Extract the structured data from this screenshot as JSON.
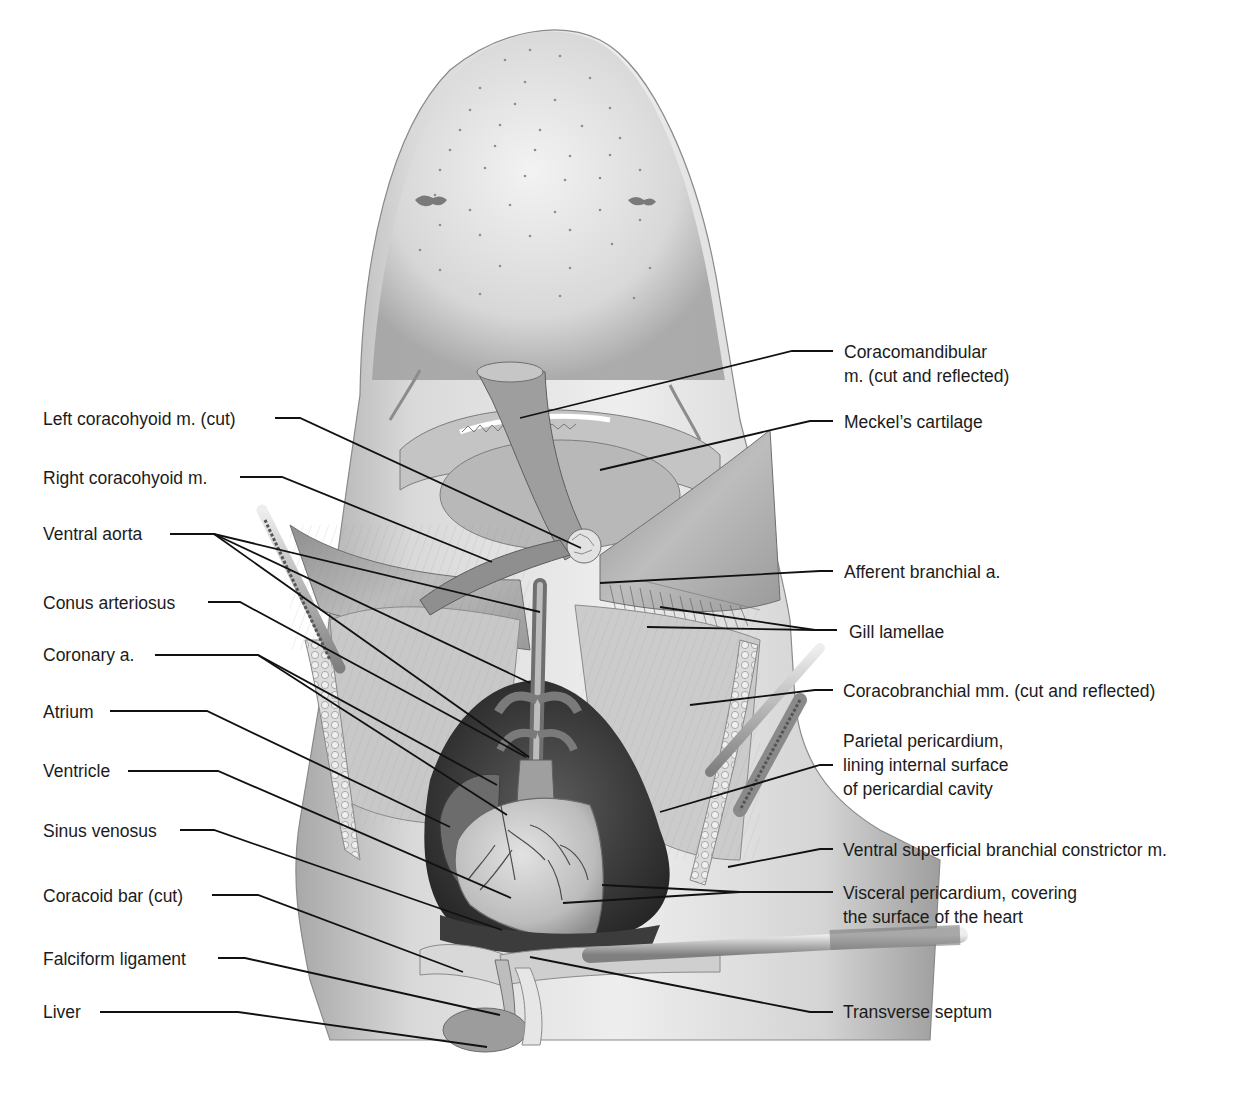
{
  "figure": {
    "colors": {
      "background": "#ffffff",
      "skin_light": "#e6e6e6",
      "skin_mid": "#bdbdbd",
      "skin_dark": "#8a8a8a",
      "muscle": "#a9a9a9",
      "heart": "#cfcfcf",
      "cavity": "#3a3a3a",
      "leader": "#111111"
    }
  },
  "labels_left": [
    {
      "id": "left-coracohyoid",
      "lines": [
        "Left coracohyoid m. (cut)"
      ],
      "x": 43,
      "y": 407
    },
    {
      "id": "right-coracohyoid",
      "lines": [
        "Right coracohyoid m."
      ],
      "x": 43,
      "y": 466
    },
    {
      "id": "ventral-aorta",
      "lines": [
        "Ventral aorta"
      ],
      "x": 43,
      "y": 522
    },
    {
      "id": "conus-arteriosus",
      "lines": [
        "Conus arteriosus"
      ],
      "x": 43,
      "y": 591
    },
    {
      "id": "coronary-a",
      "lines": [
        "Coronary a."
      ],
      "x": 43,
      "y": 643
    },
    {
      "id": "atrium",
      "lines": [
        "Atrium"
      ],
      "x": 43,
      "y": 700
    },
    {
      "id": "ventricle",
      "lines": [
        "Ventricle"
      ],
      "x": 43,
      "y": 759
    },
    {
      "id": "sinus-venosus",
      "lines": [
        "Sinus venosus"
      ],
      "x": 43,
      "y": 819
    },
    {
      "id": "coracoid-bar",
      "lines": [
        "Coracoid bar (cut)"
      ],
      "x": 43,
      "y": 884
    },
    {
      "id": "falciform-ligament",
      "lines": [
        "Falciform ligament"
      ],
      "x": 43,
      "y": 947
    },
    {
      "id": "liver",
      "lines": [
        "Liver"
      ],
      "x": 43,
      "y": 1000
    }
  ],
  "labels_right": [
    {
      "id": "coracomandibular",
      "lines": [
        "Coracomandibular",
        "m. (cut and reflected)"
      ],
      "x": 844,
      "y": 340
    },
    {
      "id": "meckels-cartilage",
      "lines": [
        "Meckel’s cartilage"
      ],
      "x": 844,
      "y": 410
    },
    {
      "id": "afferent-branchial",
      "lines": [
        "Afferent branchial a."
      ],
      "x": 844,
      "y": 560
    },
    {
      "id": "gill-lamellae",
      "lines": [
        "Gill lamellae"
      ],
      "x": 849,
      "y": 620
    },
    {
      "id": "coracobranchial",
      "lines": [
        "Coracobranchial mm. (cut and reflected)"
      ],
      "x": 843,
      "y": 679
    },
    {
      "id": "parietal-pericardium",
      "lines": [
        "Parietal pericardium,",
        "lining internal surface",
        "of pericardial cavity"
      ],
      "x": 843,
      "y": 729
    },
    {
      "id": "ventral-superficial",
      "lines": [
        "Ventral superficial branchial constrictor m."
      ],
      "x": 843,
      "y": 838
    },
    {
      "id": "visceral-pericardium",
      "lines": [
        "Visceral pericardium, covering",
        "the surface of the heart"
      ],
      "x": 843,
      "y": 881
    },
    {
      "id": "transverse-septum",
      "lines": [
        "Transverse septum"
      ],
      "x": 843,
      "y": 1000
    }
  ],
  "leaders": [
    {
      "for": "left-coracohyoid",
      "points": [
        [
          275,
          418
        ],
        [
          300,
          418
        ],
        [
          581,
          548
        ]
      ]
    },
    {
      "for": "right-coracohyoid",
      "points": [
        [
          240,
          477
        ],
        [
          282,
          477
        ],
        [
          492,
          562
        ]
      ]
    },
    {
      "for": "ventral-aorta",
      "points": [
        [
          170,
          534
        ],
        [
          214,
          534
        ],
        [
          540,
          612
        ]
      ]
    },
    {
      "for": "ventral-aorta",
      "points": [
        [
          214,
          534
        ],
        [
          530,
          683
        ]
      ]
    },
    {
      "for": "ventral-aorta",
      "points": [
        [
          214,
          534
        ],
        [
          529,
          757
        ]
      ]
    },
    {
      "for": "conus-arteriosus",
      "points": [
        [
          208,
          602
        ],
        [
          240,
          602
        ],
        [
          526,
          757
        ]
      ]
    },
    {
      "for": "coronary-a",
      "points": [
        [
          155,
          655
        ],
        [
          258,
          655
        ],
        [
          497,
          785
        ]
      ]
    },
    {
      "for": "coronary-a",
      "points": [
        [
          258,
          655
        ],
        [
          507,
          815
        ]
      ]
    },
    {
      "for": "atrium",
      "points": [
        [
          110,
          711
        ],
        [
          207,
          711
        ],
        [
          450,
          827
        ]
      ]
    },
    {
      "for": "ventricle",
      "points": [
        [
          128,
          771
        ],
        [
          218,
          771
        ],
        [
          511,
          898
        ]
      ]
    },
    {
      "for": "sinus-venosus",
      "points": [
        [
          180,
          830
        ],
        [
          214,
          830
        ],
        [
          502,
          930
        ]
      ]
    },
    {
      "for": "coracoid-bar",
      "points": [
        [
          212,
          895
        ],
        [
          258,
          895
        ],
        [
          463,
          972
        ]
      ]
    },
    {
      "for": "falciform-ligament",
      "points": [
        [
          218,
          958
        ],
        [
          245,
          958
        ],
        [
          500,
          1015
        ]
      ]
    },
    {
      "for": "liver",
      "points": [
        [
          100,
          1012
        ],
        [
          238,
          1012
        ],
        [
          487,
          1047
        ]
      ]
    },
    {
      "for": "coracomandibular",
      "points": [
        [
          833,
          351
        ],
        [
          792,
          351
        ],
        [
          520,
          418
        ]
      ]
    },
    {
      "for": "meckels-cartilage",
      "points": [
        [
          833,
          421
        ],
        [
          810,
          421
        ],
        [
          600,
          470
        ]
      ]
    },
    {
      "for": "afferent-branchial",
      "points": [
        [
          833,
          571
        ],
        [
          820,
          571
        ],
        [
          600,
          583
        ]
      ]
    },
    {
      "for": "gill-lamellae",
      "points": [
        [
          837,
          630
        ],
        [
          815,
          630
        ],
        [
          647,
          627
        ]
      ]
    },
    {
      "for": "gill-lamellae",
      "points": [
        [
          815,
          630
        ],
        [
          660,
          607
        ]
      ]
    },
    {
      "for": "coracobranchial",
      "points": [
        [
          833,
          690
        ],
        [
          815,
          690
        ],
        [
          690,
          705
        ]
      ]
    },
    {
      "for": "parietal-pericardium",
      "points": [
        [
          833,
          765
        ],
        [
          820,
          765
        ],
        [
          660,
          812
        ]
      ]
    },
    {
      "for": "ventral-superficial",
      "points": [
        [
          833,
          849
        ],
        [
          820,
          849
        ],
        [
          728,
          867
        ]
      ]
    },
    {
      "for": "visceral-pericardium",
      "points": [
        [
          833,
          892
        ],
        [
          740,
          892
        ],
        [
          602,
          885
        ]
      ]
    },
    {
      "for": "visceral-pericardium",
      "points": [
        [
          740,
          892
        ],
        [
          563,
          903
        ]
      ]
    },
    {
      "for": "transverse-septum",
      "points": [
        [
          833,
          1012
        ],
        [
          810,
          1012
        ],
        [
          530,
          957
        ]
      ]
    }
  ]
}
